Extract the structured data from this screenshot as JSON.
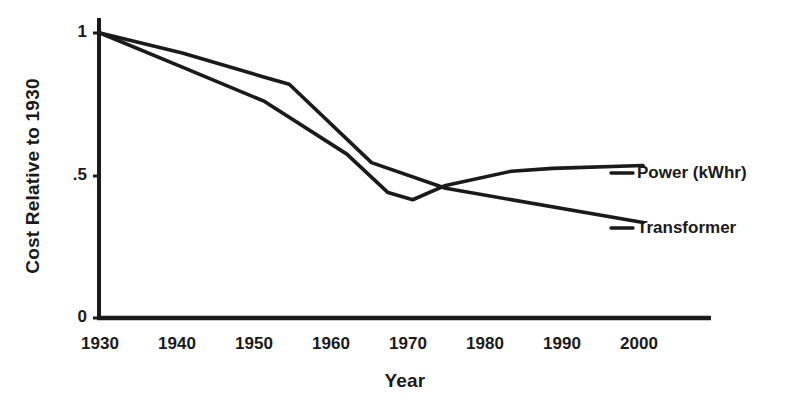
{
  "chart_data": {
    "type": "line",
    "title": "",
    "xlabel": "Year",
    "ylabel": "Cost Relative to 1930",
    "xlim": [
      1930,
      2000
    ],
    "ylim": [
      0,
      1.05
    ],
    "xticks": [
      1930,
      1940,
      1950,
      1960,
      1970,
      1980,
      1990,
      2000
    ],
    "xtick_labels": [
      "1930",
      "1940",
      "1950",
      "1960",
      "1970",
      "1980",
      "1990",
      "2000"
    ],
    "yticks": [
      0,
      0.5,
      1
    ],
    "ytick_labels": [
      "0",
      ".5",
      "1"
    ],
    "grid": false,
    "legend_position": "right-inline-labels",
    "series": [
      {
        "name": "Power (kWhr)",
        "label": "Power (kWhr)",
        "color": "#1a1a1a",
        "x": [
          1930,
          1940,
          1950,
          1960,
          1965,
          1968,
          1972,
          1980,
          1985,
          1996
        ],
        "y": [
          1.0,
          0.88,
          0.76,
          0.575,
          0.44,
          0.415,
          0.465,
          0.515,
          0.525,
          0.535
        ]
      },
      {
        "name": "Transformer",
        "label": "Transformer",
        "color": "#1a1a1a",
        "x": [
          1930,
          1940,
          1950,
          1953,
          1963,
          1972,
          1996
        ],
        "y": [
          1.0,
          0.93,
          0.845,
          0.82,
          0.545,
          0.455,
          0.335
        ]
      }
    ],
    "annotations": [
      {
        "text": "Power (kWhr)",
        "x": 1998,
        "y": 0.535
      },
      {
        "text": "Transformer",
        "x": 1998,
        "y": 0.335
      }
    ]
  },
  "axes": {
    "y_title": "Cost Relative to 1930",
    "x_title": "Year",
    "x_tick_labels": [
      "1930",
      "1940",
      "1950",
      "1960",
      "1970",
      "1980",
      "1990",
      "2000"
    ],
    "y_tick_labels": [
      "1",
      ".5",
      "0"
    ]
  },
  "labels": {
    "power": "Power (kWhr)",
    "transformer": "Transformer"
  },
  "colors": {
    "line": "#1a1a1a",
    "axis": "#1a1a1a",
    "background": "#ffffff"
  }
}
